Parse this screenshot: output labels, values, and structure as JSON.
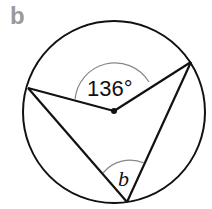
{
  "panel": {
    "label": "b"
  },
  "diagram": {
    "circle": {
      "cx": 114,
      "cy": 112,
      "r": 91
    },
    "center": {
      "x": 114,
      "y": 111
    },
    "points": {
      "left": {
        "x": 28,
        "y": 88
      },
      "right": {
        "x": 191,
        "y": 62
      },
      "bottom": {
        "x": 127,
        "y": 202
      }
    },
    "central_angle": {
      "label": "136°",
      "value": 136
    },
    "inscribed_angle": {
      "label": "b"
    },
    "colors": {
      "stroke": "#111111",
      "arc": "#888888",
      "label": "#9a9a9a"
    }
  }
}
